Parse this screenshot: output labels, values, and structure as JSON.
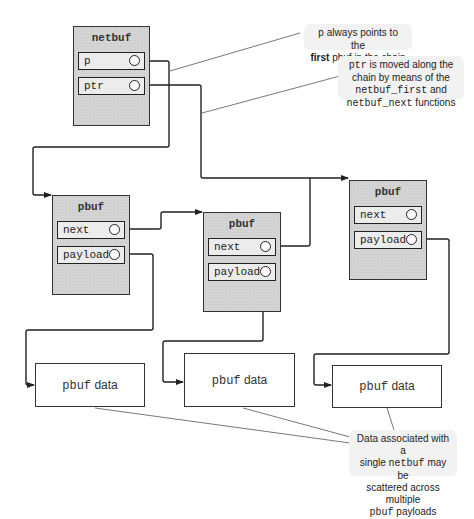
{
  "diagram": {
    "netbuf": {
      "title": "netbuf",
      "fields": [
        {
          "label": "p"
        },
        {
          "label": "ptr"
        }
      ]
    },
    "pbufs": [
      {
        "title": "pbuf",
        "fields": [
          {
            "label": "next"
          },
          {
            "label": "payload"
          }
        ]
      },
      {
        "title": "pbuf",
        "fields": [
          {
            "label": "next"
          },
          {
            "label": "payload"
          }
        ]
      },
      {
        "title": "pbuf",
        "fields": [
          {
            "label": "next"
          },
          {
            "label": "payload"
          }
        ]
      }
    ],
    "data_boxes": [
      {
        "mono": "pbuf",
        "text": " data"
      },
      {
        "mono": "pbuf",
        "text": " data"
      },
      {
        "mono": "pbuf",
        "text": " data"
      }
    ],
    "callouts": {
      "p_note": {
        "line1_mono": "p",
        "line1_text": " always points to the",
        "line2_bold": "first",
        "line2_text": " pbuf in the chain"
      },
      "ptr_note": {
        "line1_mono": "ptr",
        "line1_text": " is moved along the",
        "line2_text": "chain by means of the",
        "line3_mono": "netbuf_first",
        "line3_text": " and",
        "line4_mono": "netbuf_next",
        "line4_text": " functions"
      },
      "data_note": {
        "line1_text": "Data associated with a",
        "line2_text_a": "single ",
        "line2_mono": "netbuf",
        "line2_text_b": " may be",
        "line3_text": "scattered across multiple",
        "line4_mono": "pbuf",
        "line4_text": " payloads"
      }
    },
    "colors": {
      "struct_fill": "#d4d4d4",
      "field_fill": "#ececec",
      "line": "#222222",
      "callout_fill": "#f2f2f2"
    }
  }
}
